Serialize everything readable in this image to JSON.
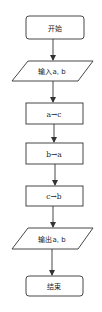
{
  "diagram": {
    "type": "flowchart",
    "direction": "top-to-bottom",
    "colors": {
      "stroke": "#333333",
      "fill": "#ffffff",
      "text": "#222222"
    },
    "nodes": [
      {
        "id": "start",
        "shape": "rounded-rectangle",
        "label": "开始"
      },
      {
        "id": "input",
        "shape": "parallelogram",
        "label": "输入a, b"
      },
      {
        "id": "step1",
        "shape": "rectangle",
        "label": "a→c"
      },
      {
        "id": "step2",
        "shape": "rectangle",
        "label": "b→a"
      },
      {
        "id": "step3",
        "shape": "rectangle",
        "label": "c→b"
      },
      {
        "id": "output",
        "shape": "parallelogram",
        "label": "输出a, b"
      },
      {
        "id": "end",
        "shape": "rounded-rectangle",
        "label": "结束"
      }
    ],
    "edges": [
      {
        "from": "start",
        "to": "input"
      },
      {
        "from": "input",
        "to": "step1"
      },
      {
        "from": "step1",
        "to": "step2"
      },
      {
        "from": "step2",
        "to": "step3"
      },
      {
        "from": "step3",
        "to": "output"
      },
      {
        "from": "output",
        "to": "end"
      }
    ]
  }
}
